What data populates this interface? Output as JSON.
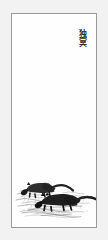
{
  "artwork": {
    "medium": "ink-on-paper",
    "orientation": "vertical-hanging-scroll",
    "canvas": {
      "width": 108,
      "height": 240,
      "background_color": "#f2f2f2"
    },
    "frame": {
      "border_color": "#9a9a9a",
      "paper_color": "#fefefe",
      "left": 11,
      "top": 13,
      "width": 86,
      "height": 215
    },
    "inscription": {
      "position": "top-right",
      "direction": "vertical",
      "ink_color": "#2b2b2b",
      "characters": [
        "独",
        "冥"
      ]
    },
    "scene": {
      "position": "bottom",
      "description": "two dark animals in sketchy grass",
      "ink_color": "#1a1a1a",
      "grass_color": "#555555",
      "subjects": [
        {
          "name": "upper-left-animal",
          "pose": "crouching-facing-left",
          "has_long_tail": true
        },
        {
          "name": "lower-right-animal",
          "pose": "walking-facing-left",
          "has_long_tail": true
        }
      ]
    },
    "negative_space": {
      "label": "blank paper expanse",
      "region": "middle"
    }
  }
}
